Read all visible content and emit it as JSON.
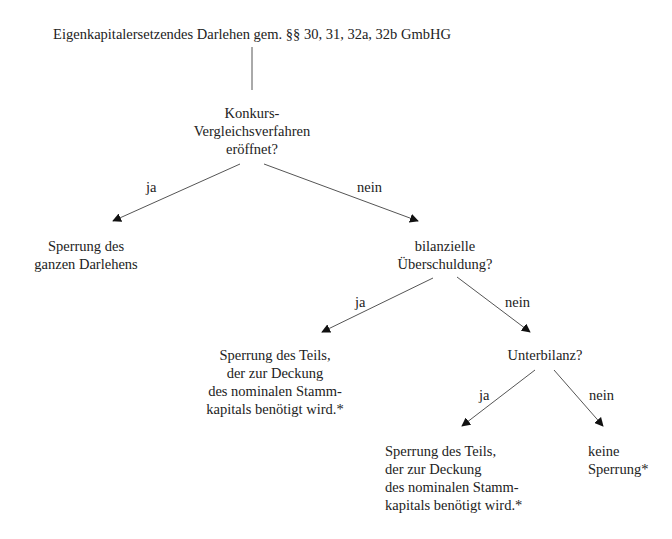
{
  "diagram": {
    "type": "decision-tree",
    "root": {
      "label": "Eigenkapitalersetzendes Darlehen gem. §§ 30, 31, 32a, 32b GmbHG"
    },
    "nodes": {
      "q1": {
        "lines": [
          "Konkurs-",
          "Vergleichsverfahren",
          "eröffnet?"
        ]
      },
      "r1": {
        "lines": [
          "Sperrung des",
          "ganzen Darlehens"
        ]
      },
      "q2": {
        "lines": [
          "bilanzielle",
          "Überschuldung?"
        ]
      },
      "r2": {
        "lines": [
          "Sperrung des Teils,",
          "der zur Deckung",
          "des nominalen Stamm-",
          "kapitals benötigt wird.*"
        ]
      },
      "q3": {
        "lines": [
          "Unterbilanz?"
        ]
      },
      "r3": {
        "lines": [
          "Sperrung des Teils,",
          "der zur Deckung",
          "des nominalen Stamm-",
          "kapitals benötigt wird.*"
        ]
      },
      "r4": {
        "lines": [
          "keine",
          "Sperrung*"
        ]
      }
    },
    "edges": [
      {
        "from": "root",
        "to": "q1",
        "label": ""
      },
      {
        "from": "q1",
        "to": "r1",
        "label": "ja"
      },
      {
        "from": "q1",
        "to": "q2",
        "label": "nein"
      },
      {
        "from": "q2",
        "to": "r2",
        "label": "ja"
      },
      {
        "from": "q2",
        "to": "q3",
        "label": "nein"
      },
      {
        "from": "q3",
        "to": "r3",
        "label": "ja"
      },
      {
        "from": "q3",
        "to": "r4",
        "label": "nein"
      }
    ],
    "colors": {
      "text": "#222222",
      "line": "#555555",
      "arrowhead": "#111111",
      "background": "#ffffff"
    }
  }
}
